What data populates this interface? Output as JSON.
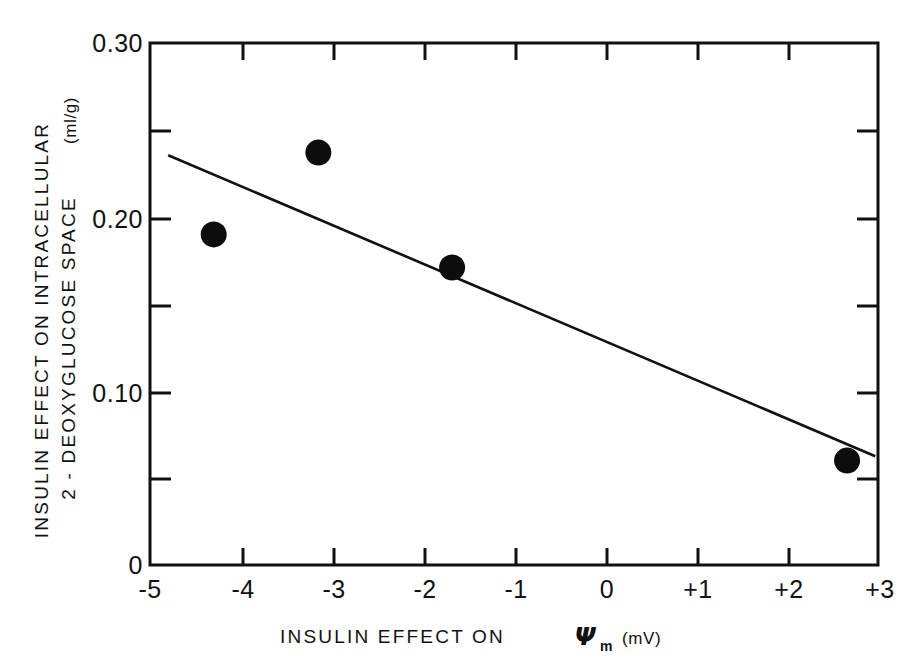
{
  "chart_data": {
    "type": "scatter",
    "title": "",
    "xlabel": "INSULIN EFFECT ON Ψm (mV)",
    "xlabel_parts": {
      "text_before": "INSULIN  EFFECT  ON",
      "symbol": "Ψ",
      "symbol_subscript": "m",
      "unit": "(mV)"
    },
    "ylabel": "INSULIN EFFECT ON INTRACELLULAR 2-DEOXYGLUCOSE SPACE (ml/g)",
    "ylabel_line1": "INSULIN  EFFECT  ON  INTRACELLULAR",
    "ylabel_line2": "2 - DEOXYGLUCOSE  SPACE",
    "ylabel_unit": "(ml/g)",
    "xlim": [
      -5,
      3
    ],
    "ylim": [
      0,
      0.3
    ],
    "x_major_ticks": [
      -5,
      -4,
      -3,
      -2,
      -1,
      0,
      1,
      2,
      3
    ],
    "x_tick_labels": [
      "-5",
      "-4",
      "-3",
      "-2",
      "-1",
      "0",
      "+1",
      "+2",
      "+3"
    ],
    "y_major_ticks": [
      0,
      0.1,
      0.2,
      0.3
    ],
    "y_tick_labels": [
      "0",
      "0.10",
      "0.20",
      "0.30"
    ],
    "y_minor_ticks": [
      0.05,
      0.15,
      0.25
    ],
    "grid": false,
    "legend": null,
    "marker_color": "#0d0d0d",
    "line_color": "#111111",
    "points": [
      {
        "x": -4.3,
        "y": 0.19
      },
      {
        "x": -3.15,
        "y": 0.237
      },
      {
        "x": -1.68,
        "y": 0.171
      },
      {
        "x": 2.66,
        "y": 0.06
      }
    ],
    "fit_line": {
      "label": "regression line",
      "x_start": -4.8,
      "y_start": 0.2355,
      "x_end": 2.97,
      "y_end": 0.0625
    }
  }
}
